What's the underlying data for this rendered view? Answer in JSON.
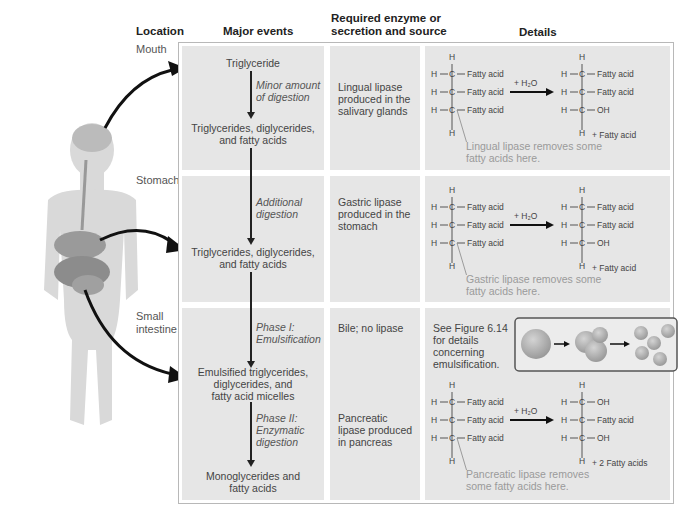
{
  "headers": {
    "location": "Location",
    "major_events": "Major events",
    "enzyme_line1": "Required enzyme or",
    "enzyme_line2": "secretion and source",
    "details": "Details"
  },
  "rows": [
    {
      "location": "Mouth",
      "start": "Triglyceride",
      "process": [
        "Minor amount",
        "of digestion"
      ],
      "result": [
        "Triglycerides, diglycerides,",
        "and fatty acids"
      ],
      "enzyme": [
        "Lingual lipase",
        "produced in the",
        "salivary glands"
      ],
      "reactant": [
        "Fatty acid",
        "Fatty acid",
        "Fatty acid"
      ],
      "product": [
        "Fatty acid",
        "Fatty acid",
        "OH"
      ],
      "byproduct": "+ Fatty acid",
      "note": [
        "Lingual lipase removes some",
        "fatty acids here."
      ]
    },
    {
      "location": "Stomach",
      "process": [
        "Additional",
        "digestion"
      ],
      "result": [
        "Triglycerides, diglycerides,",
        "and fatty acids"
      ],
      "enzyme": [
        "Gastric lipase",
        "produced in the",
        "stomach"
      ],
      "reactant": [
        "Fatty acid",
        "Fatty acid",
        "Fatty acid"
      ],
      "product": [
        "Fatty acid",
        "Fatty acid",
        "OH"
      ],
      "byproduct": "+ Fatty acid",
      "note": [
        "Gastric lipase removes some",
        "fatty acids here."
      ]
    },
    {
      "location": [
        "Small",
        "intestine"
      ],
      "process1": [
        "Phase I:",
        "Emulsification"
      ],
      "result1": [
        "Emulsified triglycerides,",
        "diglycerides, and",
        "fatty acid micelles"
      ],
      "process2": [
        "Phase II:",
        "Enzymatic",
        "digestion"
      ],
      "result2": [
        "Monoglycerides and",
        "fatty acids"
      ],
      "enzyme1": "Bile; no lipase",
      "enzyme2": [
        "Pancreatic",
        "lipase produced",
        "in pancreas"
      ],
      "figure_ref": [
        "See Figure 6.14",
        "for details",
        "concerning",
        "emulsification."
      ],
      "reactant": [
        "Fatty acid",
        "Fatty acid",
        "Fatty acid"
      ],
      "product": [
        "OH",
        "Fatty acid",
        "OH"
      ],
      "byproduct": "+ 2 Fatty acids",
      "note": [
        "Pancreatic lipase removes",
        "some fatty acids here."
      ]
    }
  ],
  "chem": {
    "H": "H",
    "C": "C",
    "water": "+ H₂O"
  }
}
